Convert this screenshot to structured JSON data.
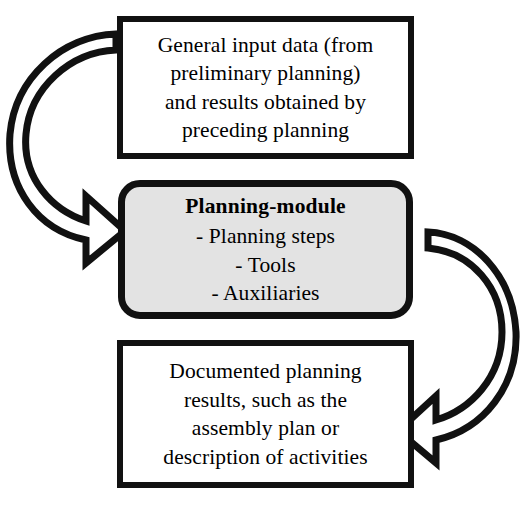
{
  "diagram": {
    "type": "cycle-flow",
    "background_color": "#ffffff",
    "outline_color": "#111111",
    "module_fill_color": "#e3e3e3",
    "nodes": [
      {
        "id": "input",
        "shape": "rectangle",
        "fill": "#ffffff",
        "lines": [
          "General input data (from",
          "preliminary planning)",
          "and results obtained by",
          "preceding planning"
        ]
      },
      {
        "id": "module",
        "shape": "rounded-rectangle",
        "fill": "#e3e3e3",
        "title": "Planning-module",
        "lines": [
          "- Planning steps",
          "- Tools",
          "- Auxiliaries"
        ]
      },
      {
        "id": "output",
        "shape": "rectangle",
        "fill": "#ffffff",
        "lines": [
          "Documented planning",
          "results, such as the",
          "assembly plan or",
          "description of activities"
        ]
      }
    ],
    "connectors": [
      {
        "id": "arrow-input-to-module",
        "from": "input",
        "to": "module",
        "style": "curved-block-arrow",
        "side": "left",
        "direction": "down-right"
      },
      {
        "id": "arrow-module-to-output",
        "from": "module",
        "to": "output",
        "style": "curved-block-arrow",
        "side": "right",
        "direction": "down-left"
      }
    ]
  }
}
